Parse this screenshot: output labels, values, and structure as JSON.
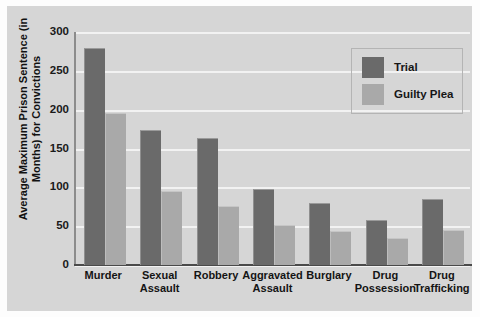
{
  "chart_data": {
    "type": "bar",
    "title": "",
    "xlabel": "",
    "ylabel": "Average Maximum Prison Sentence (in Months)\nfor Convictions",
    "ylim": [
      0,
      300
    ],
    "yticks": [
      0,
      50,
      100,
      150,
      200,
      250,
      300
    ],
    "ytick_labels": [
      "0",
      "50",
      "100",
      "150",
      "200",
      "250",
      "300"
    ],
    "grid": true,
    "legend_position": "upper right",
    "categories": [
      "Murder",
      "Sexual\nAssault",
      "Robbery",
      "Aggravated\nAssault",
      "Burglary",
      "Drug\nPossession",
      "Drug\nTrafficking"
    ],
    "series": [
      {
        "name": "Trial",
        "color": "#6a6a6a",
        "values": [
          278,
          173,
          162,
          97,
          79,
          57,
          84
        ]
      },
      {
        "name": "Guilty Plea",
        "color": "#a9a9a9",
        "values": [
          195,
          94,
          75,
          50,
          43,
          33,
          44
        ]
      }
    ]
  },
  "legend": {
    "items": [
      {
        "label": "Trial",
        "color": "#6a6a6a"
      },
      {
        "label": "Guilty Plea",
        "color": "#a9a9a9"
      }
    ]
  },
  "colors": {
    "trial": "#6a6a6a",
    "guilty_plea": "#a9a9a9",
    "plot_background": "#d6d6d6",
    "gridline": "#f2f2f2",
    "axis": "#4a4a4a",
    "text": "#141414"
  }
}
